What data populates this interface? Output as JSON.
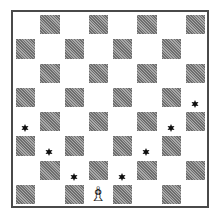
{
  "diagram": {
    "type": "chessboard",
    "size": 8,
    "light_color": "#ffffff",
    "dark_color": "#8a8a8a",
    "border_color": "#4a4a4a",
    "piece": {
      "name": "white-bishop",
      "glyph": "♗",
      "square": "d1",
      "row": 7,
      "col": 3
    },
    "markers": [
      {
        "square": "h5",
        "row": 3,
        "col": 7,
        "icon": "star-icon"
      },
      {
        "square": "a4",
        "row": 4,
        "col": 0,
        "icon": "star-icon"
      },
      {
        "square": "g4",
        "row": 4,
        "col": 6,
        "icon": "star-icon"
      },
      {
        "square": "b3",
        "row": 5,
        "col": 1,
        "icon": "star-icon"
      },
      {
        "square": "f3",
        "row": 5,
        "col": 5,
        "icon": "star-icon"
      },
      {
        "square": "c2",
        "row": 6,
        "col": 2,
        "icon": "star-icon"
      },
      {
        "square": "e2",
        "row": 6,
        "col": 4,
        "icon": "star-icon"
      }
    ]
  }
}
